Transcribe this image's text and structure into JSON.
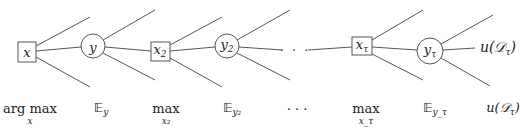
{
  "nodes": [
    {
      "id": "x",
      "kind": "decision",
      "label": "x",
      "sub": ""
    },
    {
      "id": "y",
      "kind": "chance",
      "label": "y",
      "sub": ""
    },
    {
      "id": "x2",
      "kind": "decision",
      "label": "x",
      "sub": "2"
    },
    {
      "id": "y2",
      "kind": "chance",
      "label": "y",
      "sub": "2"
    },
    {
      "id": "xtau",
      "kind": "decision",
      "label": "x",
      "sub": "τ"
    },
    {
      "id": "ytau",
      "kind": "chance",
      "label": "y",
      "sub": "τ"
    }
  ],
  "ellipsis": "· · ·",
  "leaf": {
    "prefix": "u(",
    "set": "𝒟",
    "sub": "τ",
    "suffix": ")"
  },
  "operators": [
    {
      "main": "arg max",
      "under": "x"
    },
    {
      "main": "𝔼",
      "sub": "y"
    },
    {
      "main": "max",
      "under": "x₂"
    },
    {
      "main": "𝔼",
      "sub": "y₂"
    },
    {
      "main": "· · ·"
    },
    {
      "main": "max",
      "under": "x_τ"
    },
    {
      "main": "𝔼",
      "sub": "y_τ"
    },
    {
      "main": "u(𝒟",
      "sub": "τ",
      "suffix": ")"
    }
  ],
  "colors": {
    "stroke": "#555555",
    "text": "#222222",
    "background": "#ffffff"
  }
}
